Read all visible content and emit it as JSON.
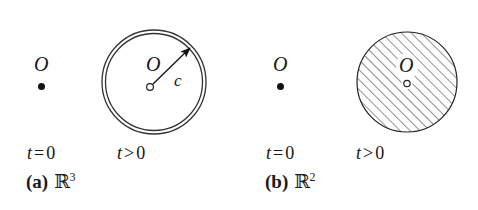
{
  "figure": {
    "background_color": "#ffffff",
    "ink_color": "#151515",
    "panels": [
      {
        "id": "a",
        "caption_tag": "(a)",
        "caption_space": "R",
        "caption_exponent": "3",
        "initial": {
          "origin_label": "O",
          "marker": "filled-dot",
          "time_label_var": "t",
          "time_label_op": "=",
          "time_label_value": "0"
        },
        "evolved": {
          "origin_label": "O",
          "marker": "open-dot",
          "shape": "double-circle",
          "fill": "none",
          "arrow_label": "c",
          "time_label_var": "t",
          "time_label_op": ">",
          "time_label_value": "0"
        }
      },
      {
        "id": "b",
        "caption_tag": "(b)",
        "caption_space": "R",
        "caption_exponent": "2",
        "initial": {
          "origin_label": "O",
          "marker": "filled-dot",
          "time_label_var": "t",
          "time_label_op": "=",
          "time_label_value": "0"
        },
        "evolved": {
          "origin_label": "O",
          "marker": "open-dot",
          "shape": "disc",
          "fill": "diagonal-hatch",
          "arrow_label": "",
          "time_label_var": "t",
          "time_label_op": ">",
          "time_label_value": "0"
        }
      }
    ]
  }
}
